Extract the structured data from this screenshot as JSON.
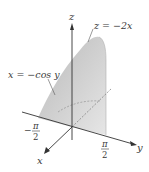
{
  "figure": {
    "type": "3d-region-sketch",
    "axes": {
      "x_label": "x",
      "y_label": "y",
      "z_label": "z"
    },
    "tick_labels": {
      "neg_half_pi_num": "π",
      "neg_half_pi_den": "2",
      "neg_half_pi_sign": "−",
      "pos_half_pi_num": "π",
      "pos_half_pi_den": "2"
    },
    "surface_labels": {
      "top_surface": "z = −2x",
      "side_surface": "x = −cos y"
    },
    "colors": {
      "shade": "#c9c9c9",
      "shade_light": "#e2e2e2",
      "axis": "#333333",
      "text": "#3a3a3a"
    }
  }
}
